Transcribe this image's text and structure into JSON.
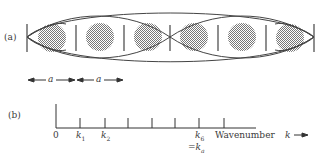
{
  "panel_a": {
    "label": "(a)",
    "spacing_label": "a",
    "cells": 6,
    "bar_x": [
      27,
      75,
      123,
      171,
      219,
      267,
      315
    ],
    "atom_x": [
      51,
      99,
      147,
      195,
      243,
      291
    ],
    "atom_radius": 14,
    "axis_y": 38,
    "stroke_color": "#444444",
    "atom_color": "#9a9a9a"
  },
  "panel_b": {
    "label": "(b)",
    "origin_label": "0",
    "tick_labels": [
      {
        "text": "k",
        "sub": "1"
      },
      {
        "text": "k",
        "sub": "2"
      },
      {
        "text": "k",
        "sub": "6"
      }
    ],
    "k6_eq": "=k",
    "k6_eq_sub": "a",
    "axis_title": "Wavenumber",
    "axis_symbol": "k",
    "arrow": "→",
    "tick_x": [
      80,
      105,
      128,
      153,
      177,
      203
    ],
    "origin_x": 56,
    "axis_end_x": 255
  }
}
